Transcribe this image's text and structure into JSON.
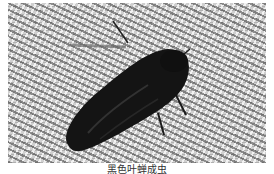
{
  "figure": {
    "caption": "黑色叶蝉成虫",
    "colors": {
      "background": "#ffffff",
      "fabric": "#cfcfcf",
      "insect": "#141414"
    }
  }
}
